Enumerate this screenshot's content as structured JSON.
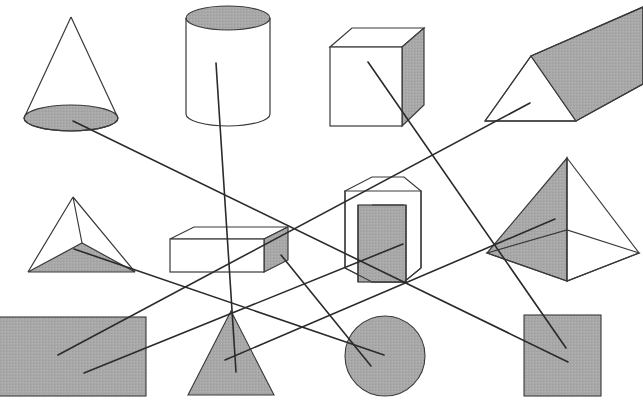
{
  "worksheet": {
    "question_number": "2.",
    "width": 643,
    "height": 402,
    "background_color": "#ffffff",
    "stroke_color": "#3a3a3a",
    "shade_color": "#a8a8a8",
    "line_color": "#2b2b2b"
  },
  "solids": [
    {
      "id": "cone",
      "name": "cone",
      "label": "Cone",
      "shaded_part": "circular base",
      "bbox": [
        24,
        16,
        118,
        130
      ],
      "connector_start": [
        73,
        121
      ]
    },
    {
      "id": "cylinder",
      "name": "cylinder",
      "label": "Cylinder",
      "shaded_part": "top circular face",
      "bbox": [
        186,
        6,
        271,
        126
      ],
      "connector_start": [
        216,
        63
      ]
    },
    {
      "id": "cube",
      "name": "cube",
      "label": "Cube",
      "shaded_part": "right square face",
      "bbox": [
        330,
        28,
        424,
        126
      ],
      "connector_start": [
        368,
        62
      ]
    },
    {
      "id": "triangular-prism",
      "name": "triangular prism",
      "label": "Triangular prism",
      "shaded_part": "slanted rectangular face",
      "bbox": [
        485,
        7,
        643,
        130
      ],
      "connector_start": [
        530,
        103
      ]
    },
    {
      "id": "tetrahedron",
      "name": "triangular pyramid",
      "label": "Triangular pyramid",
      "shaded_part": "triangular base",
      "bbox": [
        28,
        196,
        135,
        274
      ],
      "connector_start": [
        74,
        249
      ]
    },
    {
      "id": "cuboid",
      "name": "cuboid",
      "label": "Rectangular prism",
      "shaded_part": "right rectangular face",
      "bbox": [
        170,
        227,
        288,
        273
      ],
      "connector_start": [
        281,
        255
      ]
    },
    {
      "id": "hexagonal-prism",
      "name": "hexagonal prism",
      "label": "Hexagonal prism",
      "shaded_part": "front rectangular face",
      "bbox": [
        337,
        177,
        421,
        282
      ],
      "connector_start": [
        403,
        244
      ]
    },
    {
      "id": "square-pyramid",
      "name": "square pyramid",
      "label": "Square pyramid",
      "shaded_part": "left triangular face",
      "bbox": [
        487,
        157,
        639,
        281
      ],
      "connector_start": [
        555,
        219
      ]
    }
  ],
  "flat_shapes": [
    {
      "id": "gray-rectangle",
      "name": "rectangle",
      "label": "Rectangle",
      "fill": "#a8a8a8",
      "bbox": [
        0,
        317,
        146,
        396
      ],
      "connector_ends": [
        [
          58,
          355
        ],
        [
          84,
          373
        ]
      ]
    },
    {
      "id": "gray-triangle",
      "name": "triangle",
      "label": "Triangle",
      "fill": "#a8a8a8",
      "bbox": [
        188,
        311,
        274,
        395
      ],
      "connector_ends": [
        [
          225,
          360
        ],
        [
          236,
          372
        ]
      ]
    },
    {
      "id": "gray-circle",
      "name": "circle",
      "label": "Circle",
      "fill": "#a8a8a8",
      "bbox": [
        345,
        316,
        425,
        396
      ],
      "connector_ends": [
        [
          384,
          355
        ],
        [
          371,
          366
        ]
      ]
    },
    {
      "id": "gray-square",
      "name": "square",
      "label": "Square",
      "fill": "#a8a8a8",
      "bbox": [
        524,
        315,
        601,
        396
      ],
      "connector_ends": [
        [
          566,
          348
        ],
        [
          568,
          362
        ]
      ]
    }
  ],
  "connectors": [
    {
      "id": "line-cone-to-square",
      "from": "cone",
      "to": "gray-square",
      "x1": 73,
      "y1": 121,
      "x2": 568,
      "y2": 362
    },
    {
      "id": "line-cylinder-to-triangle",
      "from": "cylinder",
      "to": "gray-triangle",
      "x1": 216,
      "y1": 63,
      "x2": 236,
      "y2": 372
    },
    {
      "id": "line-cube-to-square-b",
      "from": "cube",
      "to": "gray-square",
      "x1": 368,
      "y1": 62,
      "x2": 566,
      "y2": 348
    },
    {
      "id": "line-prism-to-rectangle",
      "from": "triangular-prism",
      "to": "gray-rectangle",
      "x1": 530,
      "y1": 103,
      "x2": 58,
      "y2": 355
    },
    {
      "id": "line-tetra-to-circle",
      "from": "tetrahedron",
      "to": "gray-circle",
      "x1": 74,
      "y1": 249,
      "x2": 384,
      "y2": 355
    },
    {
      "id": "line-cuboid-to-circle-b",
      "from": "cuboid",
      "to": "gray-circle",
      "x1": 281,
      "y1": 255,
      "x2": 371,
      "y2": 366
    },
    {
      "id": "line-hexprism-to-rect-b",
      "from": "hexagonal-prism",
      "to": "gray-rectangle",
      "x1": 403,
      "y1": 244,
      "x2": 84,
      "y2": 373
    },
    {
      "id": "line-sqpyramid-to-triangle",
      "from": "square-pyramid",
      "to": "gray-triangle",
      "x1": 555,
      "y1": 219,
      "x2": 225,
      "y2": 360
    }
  ]
}
